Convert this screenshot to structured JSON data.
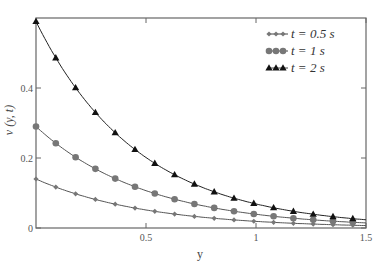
{
  "chart_data": {
    "type": "line",
    "title": "",
    "xlabel": "y",
    "ylabel": "v (y, t)",
    "xlim": [
      0,
      1.5
    ],
    "ylim": [
      0,
      0.6
    ],
    "x_ticks": [
      "0.5",
      "1",
      "1.5"
    ],
    "y_ticks": [
      "0",
      "0.2",
      "0.4"
    ],
    "grid": false,
    "legend_position": "upper right",
    "x": [
      0,
      0.09,
      0.18,
      0.27,
      0.36,
      0.45,
      0.54,
      0.63,
      0.72,
      0.81,
      0.9,
      0.99,
      1.08,
      1.17,
      1.26,
      1.35,
      1.44
    ],
    "series": [
      {
        "name": "t = 0.5 s",
        "marker": "diamond",
        "A": 0.14,
        "k": 2.0
      },
      {
        "name": "t = 1 s",
        "marker": "circle",
        "A": 0.29,
        "k": 2.0
      },
      {
        "name": "t = 2 s",
        "marker": "triangle",
        "A": 0.59,
        "k": 2.15
      }
    ]
  },
  "legend": {
    "items": [
      "t = 0.5 s",
      "t = 1 s",
      "t = 2 s"
    ]
  },
  "axes": {
    "xlabel": "y",
    "ylabel": "v (y, t)"
  }
}
